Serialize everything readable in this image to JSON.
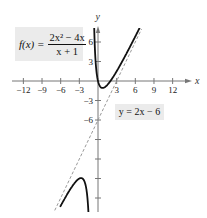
{
  "chart_data": {
    "type": "line",
    "title": "",
    "function": {
      "label_lhs": "f(x) =",
      "numerator": "2x² − 4x",
      "denominator": "x + 1",
      "expression": "(2x^2 - 4x)/(x + 1)"
    },
    "asymptotes": [
      {
        "type": "slant",
        "label": "y = 2x − 6",
        "equation": "y = 2x - 6",
        "style": "dashed"
      },
      {
        "type": "vertical",
        "x": -1,
        "style": "none"
      }
    ],
    "xlabel": "x",
    "ylabel": "y",
    "x_ticks": [
      -12,
      -9,
      -6,
      -3,
      3,
      6,
      9,
      12
    ],
    "x_tick_labels": [
      "−12",
      "−9",
      "−6",
      "−3",
      "3",
      "6",
      "9",
      "12"
    ],
    "y_ticks": [
      6,
      3,
      -3,
      -6,
      -9,
      -12,
      -15,
      -18
    ],
    "y_tick_labels": [
      "6",
      "3",
      "−3",
      "−6"
    ],
    "xlim": [
      -13.5,
      15
    ],
    "ylim": [
      -20.5,
      8.5
    ],
    "grid": false,
    "key_points": [
      {
        "name": "local-min",
        "x": 0.73,
        "y": -1.07
      },
      {
        "name": "local-max",
        "x": -2.73,
        "y": -12.93
      }
    ],
    "series": [
      {
        "name": "f(x) right branch",
        "x_range": [
          -0.92,
          6.7
        ],
        "style": "solid",
        "color": "#111111"
      },
      {
        "name": "f(x) left branch",
        "x_range": [
          -6.1,
          -1.15
        ],
        "style": "solid",
        "color": "#111111"
      },
      {
        "name": "y = 2x - 6",
        "x_range": [
          -7.3,
          7.0
        ],
        "style": "dashed",
        "color": "#999999"
      }
    ]
  },
  "labels": {
    "func_lhs": "f(x) =",
    "func_num": "2x² − 4x",
    "func_den": "x + 1",
    "asym": "y = 2x − 6"
  }
}
